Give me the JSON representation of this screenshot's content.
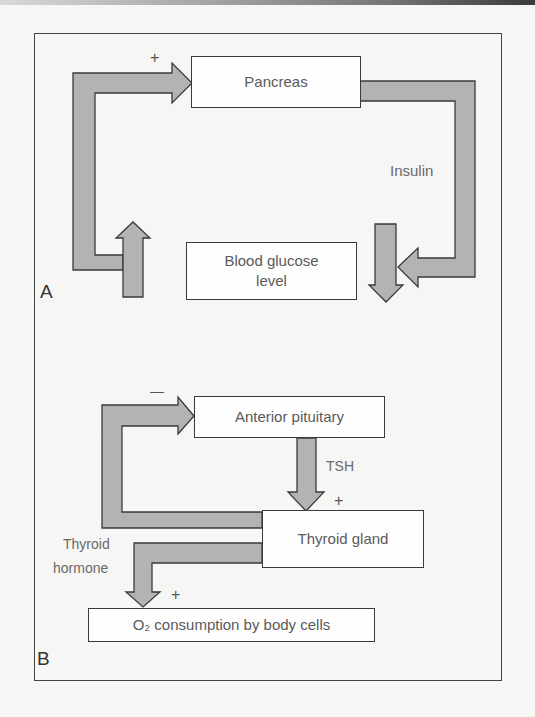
{
  "figure": {
    "panels": [
      {
        "letter": "A",
        "nodes": {
          "pancreas": "Pancreas",
          "blood_glucose": "Blood glucose level"
        },
        "labels": {
          "insulin": "Insulin",
          "pancreas_input_sign": "+"
        },
        "edges": [
          {
            "from": "Blood glucose level",
            "to": "Pancreas",
            "sign": "+"
          },
          {
            "from": "Pancreas",
            "to": "Blood glucose level",
            "label": "Insulin"
          }
        ]
      },
      {
        "letter": "B",
        "nodes": {
          "anterior_pituitary": "Anterior pituitary",
          "thyroid_gland": "Thyroid gland",
          "o2_consumption": "O₂ consumption by body cells"
        },
        "labels": {
          "tsh": "TSH",
          "thyroid_hormone_line1": "Thyroid",
          "thyroid_hormone_line2": "hormone",
          "pituitary_input_sign": "—",
          "tsh_sign": "+",
          "o2_sign": "+"
        },
        "edges": [
          {
            "from": "Anterior pituitary",
            "to": "Thyroid gland",
            "label": "TSH",
            "sign": "+"
          },
          {
            "from": "Thyroid gland",
            "to": "Anterior pituitary",
            "sign": "−"
          },
          {
            "from": "Thyroid gland",
            "to": "O₂ consumption by body cells",
            "label": "Thyroid hormone",
            "sign": "+"
          }
        ]
      }
    ],
    "colors": {
      "arrow_fill": "#b3b3b3",
      "stroke": "#3a3a3a",
      "background": "#f6f6f4"
    }
  }
}
